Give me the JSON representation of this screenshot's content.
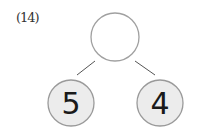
{
  "problem": {
    "label": "(14)"
  },
  "tree": {
    "root": {
      "value": "",
      "cx": 115,
      "cy": 37,
      "r": 24,
      "fill": "#ffffff",
      "stroke": "#a0a0a0"
    },
    "children": [
      {
        "value": "5",
        "cx": 71,
        "cy": 103,
        "r": 23,
        "fill": "#ececec",
        "stroke": "#9a9a9a"
      },
      {
        "value": "4",
        "cx": 160,
        "cy": 103,
        "r": 23,
        "fill": "#ececec",
        "stroke": "#9a9a9a"
      }
    ],
    "edges": [
      {
        "from": "root",
        "to": "left",
        "x1": 95,
        "y1": 61,
        "x2": 77,
        "y2": 75
      },
      {
        "from": "root",
        "to": "right",
        "x1": 135,
        "y1": 61,
        "x2": 155,
        "y2": 75
      }
    ],
    "edge_color": "#555555"
  }
}
